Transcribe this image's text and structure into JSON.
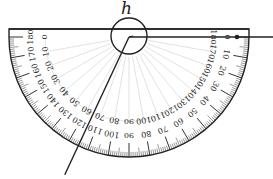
{
  "diagram": {
    "type": "protractor-angle-measurement",
    "angle_label": "h",
    "inner_scale": {
      "start": 0,
      "end": 180,
      "step": 10,
      "direction": "left-to-right"
    },
    "outer_scale": {
      "start": 180,
      "end": 0,
      "step": 10,
      "direction": "left-to-right"
    },
    "rays": [
      {
        "name": "baseline-ray",
        "direction_deg": 0
      },
      {
        "name": "slanted-ray",
        "reading_inner_deg": 115,
        "reading_outer_deg": 65
      }
    ],
    "colors": {
      "stroke": "#222222",
      "guide": "#cccccc",
      "background": "#ffffff"
    }
  }
}
